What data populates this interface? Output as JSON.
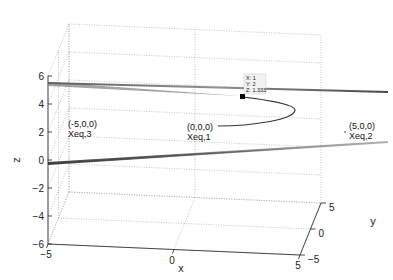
{
  "chart_data": {
    "type": "surface3d",
    "title": "",
    "xlabel": "x",
    "ylabel": "y",
    "zlabel": "z",
    "xlim": [
      -5,
      5
    ],
    "ylim": [
      -5,
      5
    ],
    "zlim": [
      -6,
      6
    ],
    "xticks": [
      -5,
      0,
      5
    ],
    "yticks": [
      -5,
      0,
      5
    ],
    "zticks": [
      -6,
      -4,
      -2,
      0,
      2,
      4,
      6
    ],
    "grid": true,
    "box": false,
    "surfaces": [
      {
        "name": "upper-sheet",
        "z_at_center": 3.3,
        "color": "#8a8a8a"
      },
      {
        "name": "lower-sheet",
        "z_at_center": -0.8,
        "color": "#8a8a8a"
      }
    ],
    "curve": {
      "name": "trajectory",
      "points": [
        [
          0,
          0,
          0
        ],
        [
          2,
          0.5,
          0.2
        ],
        [
          4,
          1,
          0.5
        ],
        [
          3.5,
          1.5,
          1.0
        ],
        [
          1,
          2,
          1.333
        ]
      ]
    },
    "equilibria": [
      {
        "coords_label": "(-5,0,0)",
        "name_label": "Xeq,3",
        "point": [
          -5,
          0,
          0
        ]
      },
      {
        "coords_label": "(0,0,0)",
        "name_label": "Xeq,1",
        "point": [
          0,
          0,
          0
        ]
      },
      {
        "coords_label": "(5,0,0)",
        "name_label": "Xeq,2",
        "point": [
          5,
          0,
          0
        ]
      }
    ],
    "datatip": {
      "x_label": "X: 1",
      "y_label": "Y: 2",
      "z_label": "Z: 1.333",
      "point": [
        1,
        2,
        1.333
      ]
    }
  }
}
